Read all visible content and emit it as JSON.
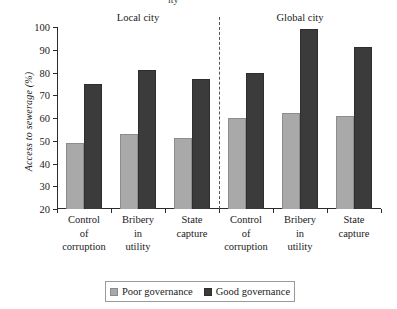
{
  "chart_data": {
    "type": "bar",
    "title": "",
    "xlabel": "",
    "ylabel": "Access to sewerage (%)",
    "ylim": [
      20,
      100
    ],
    "yticks": [
      20,
      30,
      40,
      50,
      60,
      70,
      80,
      90,
      100
    ],
    "grid": false,
    "legend_position": "bottom",
    "panels": [
      {
        "label": "Local city"
      },
      {
        "label": "Global city"
      }
    ],
    "categories": [
      "Control of corruption",
      "Bribery in utility",
      "State capture",
      "Control of corruption",
      "Bribery in utility",
      "State capture"
    ],
    "category_lines": [
      [
        "Control",
        "of",
        "corruption"
      ],
      [
        "Bribery",
        "in",
        "utility"
      ],
      [
        "State",
        "capture"
      ],
      [
        "Control",
        "of",
        "corruption"
      ],
      [
        "Bribery",
        "in",
        "utility"
      ],
      [
        "State",
        "capture"
      ]
    ],
    "series": [
      {
        "name": "Poor governance",
        "color": "#a9a9a9",
        "values": [
          49,
          53,
          51,
          60,
          62,
          61
        ]
      },
      {
        "name": "Good governance",
        "color": "#3b3b3b",
        "values": [
          75,
          81,
          77,
          80,
          99,
          91
        ]
      }
    ]
  },
  "legend": {
    "items": [
      {
        "label": "Poor governance",
        "swatch": "poor"
      },
      {
        "label": "Good governance",
        "swatch": "good"
      }
    ]
  },
  "artifacts": {
    "clipped_top_text": "ity"
  }
}
